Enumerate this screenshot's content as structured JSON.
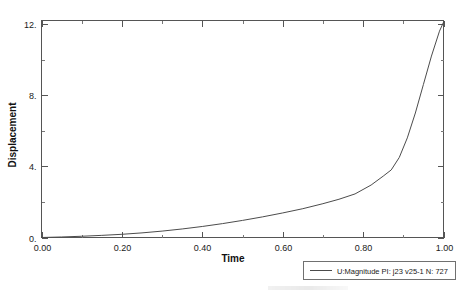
{
  "chart_data": {
    "type": "line",
    "title": "",
    "xlabel": "Time",
    "ylabel": "Displacement",
    "xlim": [
      0.0,
      1.0
    ],
    "ylim": [
      0.0,
      12.2
    ],
    "grid": false,
    "legend_position": "below-right-outside",
    "x_ticks": [
      0.0,
      0.2,
      0.4,
      0.6,
      0.8,
      1.0
    ],
    "x_tick_labels": [
      "0.00",
      "0.20",
      "0.40",
      "0.60",
      "0.80",
      "1.00"
    ],
    "x_minor_ticks": [
      0.1,
      0.3,
      0.5,
      0.7,
      0.9
    ],
    "y_ticks": [
      0,
      4,
      8,
      12
    ],
    "y_tick_labels": [
      "0.",
      "4.",
      "8.",
      "12."
    ],
    "y_minor_ticks": [
      2,
      6,
      10
    ],
    "series": [
      {
        "name": "U:Magnitude PI: j23 v25-1 N: 727",
        "color": "#4c4c4c",
        "x": [
          0.0,
          0.05,
          0.1,
          0.15,
          0.2,
          0.25,
          0.3,
          0.35,
          0.4,
          0.45,
          0.5,
          0.55,
          0.6,
          0.65,
          0.7,
          0.74,
          0.78,
          0.82,
          0.85,
          0.87,
          0.89,
          0.91,
          0.93,
          0.95,
          0.97,
          0.99,
          1.0
        ],
        "y": [
          0.0,
          0.03,
          0.07,
          0.12,
          0.18,
          0.26,
          0.36,
          0.48,
          0.62,
          0.78,
          0.96,
          1.16,
          1.38,
          1.62,
          1.9,
          2.15,
          2.45,
          2.95,
          3.45,
          3.8,
          4.5,
          5.6,
          7.0,
          8.6,
          10.2,
          11.6,
          12.1
        ]
      }
    ]
  },
  "legend": {
    "entries": [
      {
        "label": "U:Magnitude PI: j23 v25-1 N: 727"
      }
    ]
  }
}
